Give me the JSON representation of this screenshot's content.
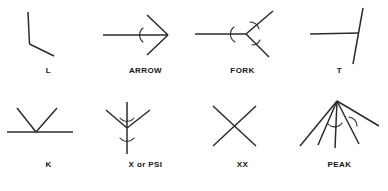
{
  "figure": {
    "background_color": "#ffffff",
    "stroke_color": "#2b2b2b",
    "label_color": "#151515",
    "columns": 4,
    "rows": 2
  },
  "cells": [
    {
      "id": "l-junction",
      "label": "L",
      "row": 1,
      "column": 1,
      "description": "two line segments meeting at a single corner",
      "segments": 2,
      "arcs": 0
    },
    {
      "id": "arrow-junction",
      "label": "ARROW",
      "row": 1,
      "column": 2,
      "description": "horizontal shaft with two barbs sweeping back from the tip",
      "segments": 3,
      "arcs": 1
    },
    {
      "id": "fork-junction",
      "label": "FORK",
      "row": 1,
      "column": 3,
      "description": "three lines radiating from one vertex at obtuse angles",
      "segments": 3,
      "arcs": 3
    },
    {
      "id": "t-junction",
      "label": "T",
      "row": 1,
      "column": 4,
      "description": "horizontal line terminating on a long near-vertical line",
      "segments": 2,
      "arcs": 0
    },
    {
      "id": "k-junction",
      "label": "K",
      "row": 2,
      "column": 1,
      "description": "straight line with a V of two rays rising from a point on it",
      "segments": 3,
      "arcs": 0
    },
    {
      "id": "x-or-psi-junction",
      "label": "X or PSI",
      "row": 2,
      "column": 2,
      "description": "vertical line with two rays branching upward from its midpoint",
      "segments": 3,
      "arcs": 2
    },
    {
      "id": "xx-junction",
      "label": "XX",
      "row": 2,
      "column": 3,
      "description": "two straight lines crossing in the middle",
      "segments": 2,
      "arcs": 0
    },
    {
      "id": "peak-junction",
      "label": "PEAK",
      "row": 2,
      "column": 4,
      "description": "five lines fanning downward from a common apex point",
      "segments": 5,
      "arcs": 2
    }
  ]
}
